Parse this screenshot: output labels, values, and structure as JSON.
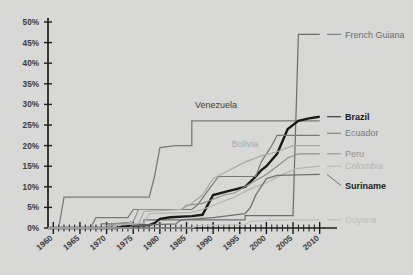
{
  "chart_data": {
    "type": "line",
    "title": "",
    "subtitle": "",
    "xlabel": "",
    "ylabel": "",
    "xlim": [
      1959,
      2011
    ],
    "ylim": [
      0,
      50
    ],
    "grid": false,
    "legend_position": "right-inline-labels",
    "y_ticks": [
      "0%",
      "5%",
      "10%",
      "15%",
      "20%",
      "25%",
      "30%",
      "35%",
      "40%",
      "45%",
      "50%"
    ],
    "y_tick_values": [
      0,
      5,
      10,
      15,
      20,
      25,
      30,
      35,
      40,
      45,
      50
    ],
    "x_ticks": [
      "1960",
      "1965",
      "1970",
      "1975",
      "1980",
      "1985",
      "1990",
      "1995",
      "2000",
      "2005",
      "2010"
    ],
    "x_tick_values": [
      1960,
      1965,
      1970,
      1975,
      1980,
      1985,
      1990,
      1995,
      2000,
      2005,
      2010
    ],
    "x_minor_step": 1,
    "series": [
      {
        "name": "French Guiana",
        "label_style": "normal",
        "label_position": "right",
        "color": "#6d6d6d",
        "width": 1.2,
        "end_value": 47,
        "points": [
          [
            1959,
            0
          ],
          [
            1969,
            0
          ],
          [
            1969,
            1
          ],
          [
            1977,
            1
          ],
          [
            1977,
            2
          ],
          [
            1996,
            2
          ],
          [
            1996,
            3
          ],
          [
            2005,
            3
          ],
          [
            2006,
            47
          ],
          [
            2010,
            47
          ]
        ]
      },
      {
        "name": "Venezuela",
        "label_style": "normal",
        "label_position": "inline",
        "color": "#7a7a7a",
        "width": 1.3,
        "end_value": 26,
        "points": [
          [
            1959,
            0
          ],
          [
            1961,
            0
          ],
          [
            1962,
            7.5
          ],
          [
            1978,
            7.5
          ],
          [
            1979,
            12.5
          ],
          [
            1980,
            19.5
          ],
          [
            1983,
            20
          ],
          [
            1986,
            20
          ],
          [
            1986,
            26
          ],
          [
            2010,
            26
          ]
        ]
      },
      {
        "name": "Brazil",
        "label_style": "bold",
        "label_position": "right",
        "color": "#1a1a1a",
        "width": 2.4,
        "end_value": 27,
        "points": [
          [
            1959,
            0
          ],
          [
            1972,
            0
          ],
          [
            1973,
            0.4
          ],
          [
            1978,
            0.7
          ],
          [
            1979,
            1.2
          ],
          [
            1980,
            2.2
          ],
          [
            1982,
            2.6
          ],
          [
            1986,
            2.9
          ],
          [
            1988,
            3.2
          ],
          [
            1989,
            5.6
          ],
          [
            1990,
            8
          ],
          [
            1993,
            9
          ],
          [
            1996,
            10
          ],
          [
            1998,
            12.5
          ],
          [
            1999,
            14
          ],
          [
            2000,
            15
          ],
          [
            2002,
            18
          ],
          [
            2003,
            21
          ],
          [
            2004,
            24
          ],
          [
            2006,
            26
          ],
          [
            2008,
            26.6
          ],
          [
            2010,
            27
          ]
        ]
      },
      {
        "name": "Ecuador",
        "label_style": "normal",
        "label_position": "right",
        "color": "#787878",
        "width": 1.2,
        "end_value": 23,
        "points": [
          [
            1959,
            0
          ],
          [
            1967,
            0
          ],
          [
            1968,
            2.5
          ],
          [
            1974,
            2.5
          ],
          [
            1975,
            4.5
          ],
          [
            1986,
            4.5
          ],
          [
            1987,
            5.5
          ],
          [
            1989,
            9
          ],
          [
            1991,
            12.5
          ],
          [
            1998,
            12.5
          ],
          [
            1999,
            16
          ],
          [
            2001,
            20
          ],
          [
            2002,
            22.5
          ],
          [
            2010,
            22.5
          ]
        ]
      },
      {
        "name": "Peru",
        "label_style": "normal",
        "label_position": "right",
        "color": "#8f8f8f",
        "width": 1.2,
        "end_value": 18,
        "points": [
          [
            1959,
            0
          ],
          [
            1970,
            0
          ],
          [
            1971,
            1
          ],
          [
            1975,
            1.5
          ],
          [
            1976,
            4.5
          ],
          [
            1984,
            4.5
          ],
          [
            1985,
            5.5
          ],
          [
            1988,
            6
          ],
          [
            1990,
            7
          ],
          [
            1992,
            8
          ],
          [
            1994,
            8.5
          ],
          [
            1996,
            10
          ],
          [
            1998,
            11.5
          ],
          [
            2000,
            13
          ],
          [
            2002,
            15
          ],
          [
            2004,
            17
          ],
          [
            2006,
            18
          ],
          [
            2010,
            18
          ]
        ]
      },
      {
        "name": "Bolivia",
        "label_style": "normal",
        "label_position": "inline",
        "color": "#a8a8a8",
        "width": 1.2,
        "end_value": 20,
        "points": [
          [
            1959,
            0
          ],
          [
            1969,
            0
          ],
          [
            1970,
            0.6
          ],
          [
            1976,
            1
          ],
          [
            1977,
            4
          ],
          [
            1984,
            4.5
          ],
          [
            1986,
            6
          ],
          [
            1988,
            8
          ],
          [
            1990,
            12
          ],
          [
            1993,
            14
          ],
          [
            1996,
            16
          ],
          [
            1999,
            17.5
          ],
          [
            2002,
            18.5
          ],
          [
            2005,
            20
          ],
          [
            2010,
            20
          ]
        ]
      },
      {
        "name": "Colombia",
        "label_style": "normal",
        "label_position": "right",
        "color": "#b4b4b4",
        "width": 1.2,
        "end_value": 15,
        "points": [
          [
            1959,
            0
          ],
          [
            1971,
            0
          ],
          [
            1972,
            0.8
          ],
          [
            1977,
            1.2
          ],
          [
            1978,
            3.5
          ],
          [
            1986,
            3.8
          ],
          [
            1988,
            4.5
          ],
          [
            1991,
            6
          ],
          [
            1994,
            7.5
          ],
          [
            1997,
            9.5
          ],
          [
            2000,
            11
          ],
          [
            2003,
            13
          ],
          [
            2006,
            14.5
          ],
          [
            2010,
            15
          ]
        ]
      },
      {
        "name": "Suriname",
        "label_style": "bold",
        "label_position": "right",
        "color": "#6f6f6f",
        "width": 1.3,
        "end_value": 13,
        "points": [
          [
            1959,
            0
          ],
          [
            1974,
            0
          ],
          [
            1975,
            0.6
          ],
          [
            1983,
            1
          ],
          [
            1984,
            2
          ],
          [
            1990,
            2.5
          ],
          [
            1993,
            3
          ],
          [
            1996,
            3.5
          ],
          [
            1997,
            5
          ],
          [
            1998,
            8
          ],
          [
            1999,
            10
          ],
          [
            2000,
            12
          ],
          [
            2002,
            12.8
          ],
          [
            2010,
            13
          ]
        ]
      },
      {
        "name": "Guyana",
        "label_style": "normal",
        "label_position": "right",
        "color": "#bdbdbd",
        "width": 1.2,
        "end_value": 2,
        "points": [
          [
            1959,
            0
          ],
          [
            1986,
            0
          ],
          [
            1987,
            0.5
          ],
          [
            1996,
            0.8
          ],
          [
            1997,
            1.6
          ],
          [
            2001,
            1.9
          ],
          [
            2010,
            2
          ]
        ]
      }
    ]
  },
  "plot": {
    "background_color": "#d8d8d6",
    "axis_color": "#1c1c1c"
  },
  "labels": {
    "french_guiana": "French Guiana",
    "venezuela": "Venezuela",
    "brazil": "Brazil",
    "ecuador": "Ecuador",
    "peru": "Peru",
    "bolivia": "Bolivia",
    "colombia": "Colombia",
    "suriname": "Suriname",
    "guyana": "Guyana"
  }
}
